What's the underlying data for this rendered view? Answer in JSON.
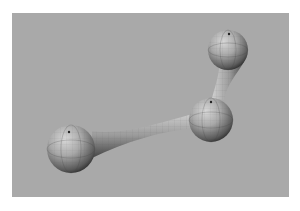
{
  "figure": {
    "background_color": "#a9a9a9",
    "sphere_color": "#9a9a9a",
    "atoms": [
      {
        "id": "atom-top-right"
      },
      {
        "id": "atom-middle"
      },
      {
        "id": "atom-bottom-left"
      }
    ],
    "bonds": [
      {
        "from": "atom-top-right",
        "to": "atom-middle"
      },
      {
        "from": "atom-middle",
        "to": "atom-bottom-left"
      }
    ]
  }
}
